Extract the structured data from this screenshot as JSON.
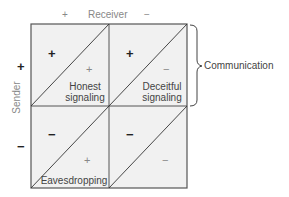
{
  "axes": {
    "receiver_label": "Receiver",
    "receiver_plus": "+",
    "receiver_minus": "−",
    "sender_label": "Sender",
    "sender_plus": "+",
    "sender_minus": "−"
  },
  "cells": [
    {
      "sender_sign": "+",
      "receiver_sign": "+",
      "label_line1": "Honest",
      "label_line2": "signaling"
    },
    {
      "sender_sign": "+",
      "receiver_sign": "−",
      "label_line1": "Deceitful",
      "label_line2": "signaling"
    },
    {
      "sender_sign": "−",
      "receiver_sign": "+",
      "label_line1": "Eavesdropping",
      "label_line2": ""
    },
    {
      "sender_sign": "−",
      "receiver_sign": "−",
      "label_line1": "",
      "label_line2": ""
    }
  ],
  "brace": {
    "label": "Communication"
  },
  "colors": {
    "cell_fill": "#f1f1f1",
    "grid_line": "#555555"
  }
}
